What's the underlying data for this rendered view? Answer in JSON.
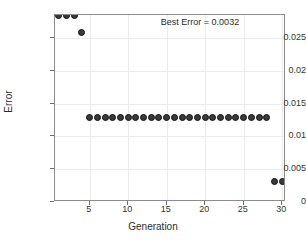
{
  "chart_data": {
    "type": "scatter",
    "title": "",
    "xlabel": "Generation",
    "ylabel": "Error",
    "xlim": [
      0.5,
      30.5
    ],
    "ylim": [
      0,
      0.0285
    ],
    "grid": true,
    "legend": null,
    "xticks": [
      5,
      10,
      15,
      20,
      25,
      30
    ],
    "xtick_labels": [
      "5",
      "10",
      "15",
      "20",
      "25",
      "30"
    ],
    "yticks": [
      0,
      0.005,
      0.01,
      0.015,
      0.02,
      0.025
    ],
    "ytick_labels": [
      "0",
      "0.005",
      "0.01",
      "0.015",
      "0.02",
      "0.025"
    ],
    "annotations": [
      {
        "text": "Best Error = 0.0032",
        "x": 15,
        "y": 0.0275
      }
    ],
    "marker": {
      "shape": "circle",
      "fill_color": "#3a3a3a",
      "edge_color": "#111111",
      "size_px": 7
    },
    "series": [
      {
        "name": "Best Error per Generation",
        "x": [
          1,
          2,
          3,
          4,
          5,
          6,
          7,
          8,
          9,
          10,
          11,
          12,
          13,
          14,
          15,
          16,
          17,
          18,
          19,
          20,
          21,
          22,
          23,
          24,
          25,
          26,
          27,
          28,
          29,
          30
        ],
        "values": [
          0.0285,
          0.0285,
          0.0285,
          0.0258,
          0.0129,
          0.0129,
          0.0129,
          0.0129,
          0.0129,
          0.0129,
          0.0129,
          0.0129,
          0.0129,
          0.0129,
          0.0129,
          0.0129,
          0.0129,
          0.0129,
          0.0129,
          0.0129,
          0.0129,
          0.0129,
          0.0129,
          0.0129,
          0.0129,
          0.0129,
          0.0129,
          0.0129,
          0.0032,
          0.0032
        ]
      }
    ]
  },
  "figure": {
    "background_color": "#ffffff",
    "axis_color": "#8c8c8c",
    "grid_color": "#ececec",
    "text_color": "#2b2b2b"
  }
}
